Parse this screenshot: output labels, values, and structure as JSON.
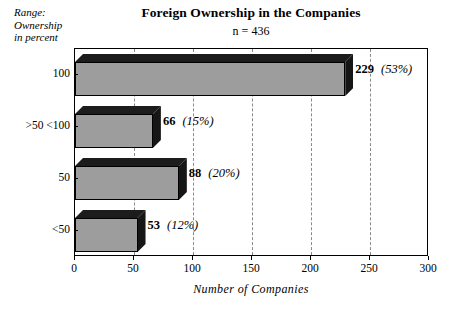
{
  "legend": {
    "lines": [
      "Range:",
      "Ownership",
      "in percent"
    ]
  },
  "title": "Foreign Ownership in the Companies",
  "subtitle": "n = 436",
  "axis": {
    "x_title": "Number of Companies",
    "x_ticks": [
      "0",
      "50",
      "100",
      "150",
      "200",
      "250",
      "300"
    ]
  },
  "bars": [
    {
      "category": "100",
      "value": 229,
      "value_label": "229",
      "percent_label": "(53%)"
    },
    {
      "category": ">50 <100",
      "value": 66,
      "value_label": "66",
      "percent_label": "(15%)"
    },
    {
      "category": "50",
      "value": 88,
      "value_label": "88",
      "percent_label": "(20%)"
    },
    {
      "category": "<50",
      "value": 53,
      "value_label": "53",
      "percent_label": "(12%)"
    }
  ],
  "chart_data": {
    "type": "bar",
    "orientation": "horizontal",
    "title": "Foreign Ownership in the Companies",
    "subtitle": "n = 436",
    "xlabel": "Number of Companies",
    "ylabel": "Range: Ownership in percent",
    "categories": [
      "100",
      ">50 <100",
      "50",
      "<50"
    ],
    "values": [
      229,
      66,
      88,
      53
    ],
    "percentages": [
      53,
      15,
      20,
      12
    ],
    "data_labels": [
      "229 (53%)",
      "66 (15%)",
      "88 (20%)",
      "53 (12%)"
    ],
    "xlim": [
      0,
      300
    ],
    "xticks": [
      0,
      50,
      100,
      150,
      200,
      250,
      300
    ],
    "grid": "vertical-dashed",
    "legend": "none",
    "total_n": 436,
    "style_3d": true,
    "colors": {
      "bar_front": "#9d9d9d",
      "bar_top": "#1c1c1c",
      "bar_side": "#161616",
      "gridline": "#8a8a8a",
      "frame": "#000000",
      "background": "#ffffff"
    }
  }
}
